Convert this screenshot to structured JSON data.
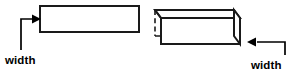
{
  "figure": {
    "background_color": "#ffffff",
    "stroke_color": "#1a1a1a",
    "label_color": "#000000",
    "canvas": {
      "width": 292,
      "height": 72
    },
    "labels": {
      "left_width": "width",
      "right_width": "width"
    },
    "shapes": [
      {
        "name": "rectangle",
        "kind": "2d-rectangle",
        "x": 40,
        "y": 6,
        "width": 99,
        "height": 26,
        "labeled_dimension": "width",
        "labeled_edge": "left"
      },
      {
        "name": "rectangular-prism",
        "kind": "3d-box",
        "front_face": {
          "x": 161,
          "y": 18,
          "width": 79,
          "height": 26
        },
        "depth_offset": {
          "dx": -6,
          "dy": -8
        },
        "hidden_edges": [
          "back-left-vertical",
          "back-bottom-horizontal"
        ],
        "labeled_dimension": "width",
        "labeled_edge": "right"
      }
    ],
    "annotations": [
      {
        "name": "left-width-callout",
        "label": "width",
        "label_x": 5,
        "label_y": 64,
        "leader_path": "M 21 50 L 21 19 L 34 19",
        "arrow_tip_x": 41,
        "arrow_tip_y": 19,
        "arrow_direction": "right"
      },
      {
        "name": "right-width-callout",
        "label": "width",
        "label_x": 251,
        "label_y": 69,
        "leader_path": "M 285 55 L 285 42 L 257 42",
        "arrow_tip_x": 247,
        "arrow_tip_y": 42,
        "arrow_direction": "left"
      }
    ]
  }
}
